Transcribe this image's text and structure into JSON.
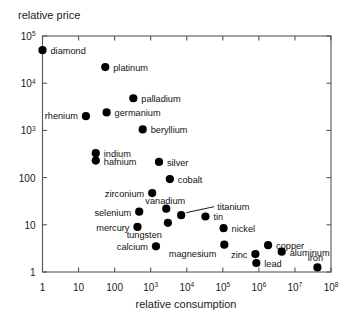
{
  "chart_data": {
    "type": "scatter",
    "title": "",
    "xlabel": "relative consumption",
    "ylabel": "relative price",
    "xscale": "log",
    "yscale": "log",
    "xlim": [
      1,
      100000000
    ],
    "ylim": [
      1,
      100000
    ],
    "grid": false,
    "legend": "none",
    "xticks": [
      1,
      10,
      100,
      1000,
      10000,
      100000,
      1000000,
      10000000,
      100000000
    ],
    "xticklabels": [
      "1",
      "10",
      "100",
      "10³",
      "10⁴",
      "10⁵",
      "10⁶",
      "10⁷",
      "10⁸"
    ],
    "yticks": [
      1,
      10,
      100,
      1000,
      10000,
      100000
    ],
    "yticklabels": [
      "1",
      "10",
      "100",
      "10³",
      "10⁴",
      "10⁵"
    ],
    "points": [
      {
        "label": "diamond",
        "x": 1,
        "y": 50000,
        "lx": 8,
        "ly": 1
      },
      {
        "label": "platinum",
        "x": 55,
        "y": 22000,
        "lx": 8,
        "ly": 1
      },
      {
        "label": "palladium",
        "x": 330,
        "y": 4800,
        "lx": 8,
        "ly": 1
      },
      {
        "label": "rhenium",
        "x": 16,
        "y": 2000,
        "lx": -8,
        "ly": 0,
        "anchor": "end"
      },
      {
        "label": "germanium",
        "x": 60,
        "y": 2400,
        "lx": 8,
        "ly": 1
      },
      {
        "label": "beryllium",
        "x": 600,
        "y": 1050,
        "lx": 8,
        "ly": 1
      },
      {
        "label": "indium",
        "x": 30,
        "y": 330,
        "lx": 8,
        "ly": 1
      },
      {
        "label": "hafnium",
        "x": 30,
        "y": 230,
        "lx": 8,
        "ly": 1
      },
      {
        "label": "silver",
        "x": 1700,
        "y": 215,
        "lx": 8,
        "ly": 1
      },
      {
        "label": "cobalt",
        "x": 3400,
        "y": 93,
        "lx": 8,
        "ly": 1
      },
      {
        "label": "zirconium",
        "x": 1100,
        "y": 47,
        "lx": -8,
        "ly": 1,
        "anchor": "end"
      },
      {
        "label": "vanadium",
        "x": 2700,
        "y": 22,
        "lx": -1,
        "ly": -8,
        "anchor": "middle"
      },
      {
        "label": "selenium",
        "x": 480,
        "y": 19,
        "lx": -8,
        "ly": 1,
        "anchor": "end"
      },
      {
        "label": "titanium",
        "x": 7000,
        "y": 16,
        "lx": 36,
        "ly": -8,
        "anchor": "start",
        "leader": true
      },
      {
        "label": "tin",
        "x": 33000,
        "y": 15,
        "lx": 8,
        "ly": 1
      },
      {
        "label": "mercury",
        "x": 430,
        "y": 9.0,
        "lx": -8,
        "ly": 1,
        "anchor": "end"
      },
      {
        "label": "tungsten",
        "x": 3000,
        "y": 11,
        "lx": -6,
        "ly": 12,
        "anchor": "end"
      },
      {
        "label": "nickel",
        "x": 105000,
        "y": 8.5,
        "lx": 8,
        "ly": 1
      },
      {
        "label": "calcium",
        "x": 1400,
        "y": 3.5,
        "lx": -8,
        "ly": 1,
        "anchor": "end"
      },
      {
        "label": "magnesium",
        "x": 110000,
        "y": 3.8,
        "lx": -8,
        "ly": 9,
        "anchor": "end"
      },
      {
        "label": "copper",
        "x": 1800000,
        "y": 3.7,
        "lx": 8,
        "ly": 1
      },
      {
        "label": "aluminum",
        "x": 4300000,
        "y": 2.7,
        "lx": 8,
        "ly": 1
      },
      {
        "label": "zinc",
        "x": 800000,
        "y": 2.4,
        "lx": -8,
        "ly": 1,
        "anchor": "end"
      },
      {
        "label": "lead",
        "x": 850000,
        "y": 1.55,
        "lx": 8,
        "ly": 1
      },
      {
        "label": "iron",
        "x": 42000000,
        "y": 1.25,
        "lx": -2,
        "ly": -9,
        "anchor": "middle"
      }
    ]
  },
  "labels": {
    "y_axis_title": "relative price",
    "x_axis_title": "relative consumption"
  }
}
